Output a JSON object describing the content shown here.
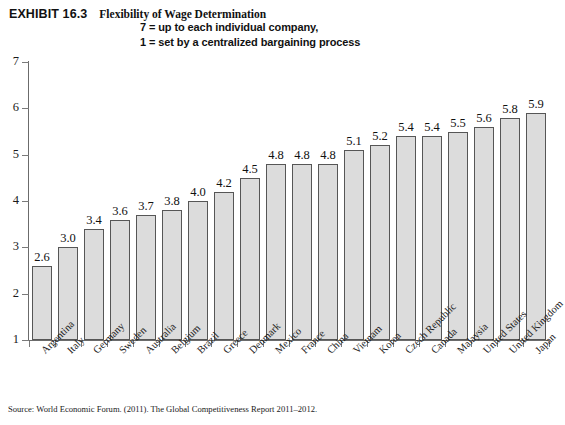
{
  "header": {
    "exhibit_label": "EXHIBIT 16.3",
    "exhibit_title": "Flexibility of Wage Determination",
    "subtitle_line_1": "7 = up to each individual company,",
    "subtitle_line_2": "1 = set by a centralized bargaining process"
  },
  "source": {
    "note": "Source: World Economic Forum. (2011). The Global Competitiveness Report 2011–2012."
  },
  "colors": {
    "bar_fill": "#dcdcdc",
    "bar_edge": "#565656",
    "axis": "#6b6b6b",
    "text": "#111111"
  },
  "chart_data": {
    "type": "bar",
    "title": "Flexibility of Wage Determination",
    "subtitle": "7 = up to each individual company, 1 = set by a centralized bargaining process",
    "xlabel": "",
    "ylabel": "",
    "ylim": [
      1,
      7
    ],
    "yticks": [
      1,
      2,
      3,
      4,
      5,
      6,
      7
    ],
    "ytick_labels": [
      "1",
      "2",
      "3",
      "4",
      "5",
      "6",
      "7"
    ],
    "grid": false,
    "legend": false,
    "baseline": 1,
    "orientation": "vertical",
    "bar_labels_shown": true,
    "categories": [
      "Argentina",
      "Italy",
      "Germany",
      "Sweden",
      "Australia",
      "Belgium",
      "Brazil",
      "Greece",
      "Denmark",
      "Mexico",
      "France",
      "China",
      "Vietnam",
      "Korea",
      "Czech Republic",
      "Canada",
      "Malaysia",
      "United States",
      "United Kingdom",
      "Japan"
    ],
    "values": [
      2.6,
      3.0,
      3.4,
      3.6,
      3.7,
      3.8,
      4.0,
      4.2,
      4.5,
      4.8,
      4.8,
      4.8,
      5.1,
      5.2,
      5.4,
      5.4,
      5.5,
      5.6,
      5.8,
      5.9
    ],
    "value_labels": [
      "2.6",
      "3.0",
      "3.4",
      "3.6",
      "3.7",
      "3.8",
      "4.0",
      "4.2",
      "4.5",
      "4.8",
      "4.8",
      "4.8",
      "5.1",
      "5.2",
      "5.4",
      "5.4",
      "5.5",
      "5.6",
      "5.8",
      "5.9"
    ]
  }
}
